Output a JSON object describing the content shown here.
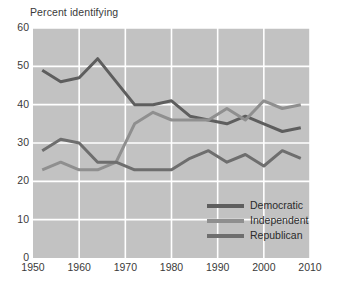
{
  "chart_data": {
    "type": "line",
    "title": "Percent identifying",
    "xlabel": "",
    "ylabel": "Percent identifying",
    "xlim": [
      1950,
      2010
    ],
    "ylim": [
      0,
      60
    ],
    "grid": true,
    "legend_position": "lower-right",
    "background_color": "#c2c2c2",
    "gridline_color": "#ffffff",
    "xticks": [
      1950,
      1960,
      1970,
      1980,
      1990,
      2000,
      2010
    ],
    "yticks": [
      0,
      10,
      20,
      30,
      40,
      50,
      60
    ],
    "x": [
      1952,
      1956,
      1960,
      1964,
      1968,
      1972,
      1976,
      1980,
      1984,
      1988,
      1992,
      1996,
      2000,
      2004,
      2008
    ],
    "series": [
      {
        "name": "Democratic",
        "color": "#5e5e5e",
        "values": [
          49,
          46,
          47,
          52,
          46,
          40,
          40,
          41,
          37,
          36,
          35,
          37,
          35,
          33,
          34
        ]
      },
      {
        "name": "Independent",
        "color": "#8f8f8f",
        "values": [
          23,
          25,
          23,
          23,
          25,
          35,
          38,
          36,
          36,
          36,
          39,
          36,
          41,
          39,
          40
        ]
      },
      {
        "name": "Republican",
        "color": "#6e6e6e",
        "values": [
          28,
          31,
          30,
          25,
          25,
          23,
          23,
          23,
          26,
          28,
          25,
          27,
          24,
          28,
          26
        ]
      }
    ]
  }
}
